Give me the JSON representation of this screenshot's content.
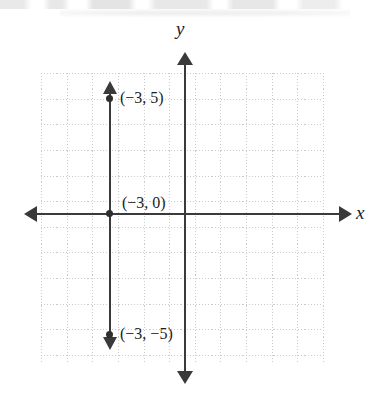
{
  "figure": {
    "kind": "coordinate-plane-graph",
    "axis_labels": {
      "x": "x",
      "y": "y"
    },
    "point_labels": {
      "top": "(−3, 5)",
      "middle": "(−3, 0)",
      "bottom": "(−3, −5)"
    },
    "colors": {
      "axis": "#3a3a3a",
      "line": "#3a3a3a",
      "point": "#2e2e2e",
      "grid": "#c2c2c2",
      "background": "#ffffff",
      "text": "#1c1c1c"
    }
  },
  "chart_data": {
    "type": "line",
    "title": "",
    "xlabel": "x",
    "ylabel": "y",
    "xlim": [
      -6,
      5
    ],
    "ylim": [
      -6,
      5
    ],
    "grid": true,
    "grid_step": 1,
    "legend": "none",
    "series": [
      {
        "name": "x = −3",
        "equation": "x = -3",
        "x": [
          -3,
          -3,
          -3
        ],
        "y": [
          5,
          0,
          -5
        ],
        "arrows": [
          "up",
          "down"
        ],
        "points": [
          {
            "label": "(−3, 5)",
            "x": -3,
            "y": 5
          },
          {
            "label": "(−3, 0)",
            "x": -3,
            "y": 0
          },
          {
            "label": "(−3, −5)",
            "x": -3,
            "y": -5
          }
        ]
      }
    ],
    "annotations": [
      {
        "text": "(−3, 5)",
        "x": -3,
        "y": 5
      },
      {
        "text": "(−3, 0)",
        "x": -3,
        "y": 0
      },
      {
        "text": "(−3, −5)",
        "x": -3,
        "y": -5
      }
    ]
  }
}
